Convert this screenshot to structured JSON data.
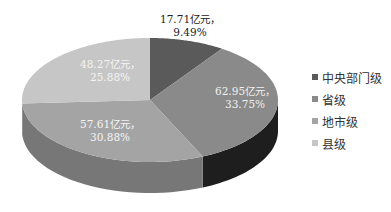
{
  "chart_data": {
    "type": "pie",
    "style": "3d",
    "title": "",
    "unit": "亿元",
    "categories": [
      "中央部门级",
      "省级",
      "地市级",
      "县级"
    ],
    "values": [
      17.71,
      62.95,
      57.61,
      48.27
    ],
    "percentages": [
      9.49,
      33.75,
      30.88,
      25.88
    ],
    "data_labels": [
      {
        "line1": "17.71亿元，",
        "line2": "9.49%"
      },
      {
        "line1": "62.95亿元，",
        "line2": "33.75%"
      },
      {
        "line1": "57.61亿元，",
        "line2": "30.88%"
      },
      {
        "line1": "48.27亿元，",
        "line2": "25.88%"
      }
    ],
    "colors": [
      "#5a5a5a",
      "#8a8a8a",
      "#a4a4a4",
      "#c6c6c6"
    ],
    "side_colors": [
      "#2a2a2a",
      "#1e1e1e",
      "#777777",
      "#8e8e8e"
    ],
    "legend_position": "right"
  },
  "legend": {
    "items": [
      {
        "label": "中央部门级",
        "color": "#5a5a5a"
      },
      {
        "label": "省级",
        "color": "#8a8a8a"
      },
      {
        "label": "地市级",
        "color": "#a4a4a4"
      },
      {
        "label": "县级",
        "color": "#c6c6c6"
      }
    ]
  }
}
